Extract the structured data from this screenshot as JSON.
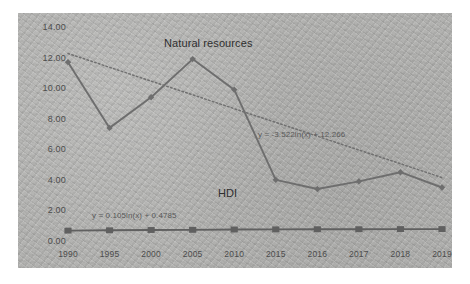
{
  "chart_data": {
    "type": "line",
    "title": "",
    "xlabel": "",
    "ylabel": "",
    "ylim": [
      0,
      14
    ],
    "ytick_step": 2,
    "grid": false,
    "legend_position": "inline-annotations",
    "categories": [
      "1990",
      "1995",
      "2000",
      "2005",
      "2010",
      "2015",
      "2016",
      "2017",
      "2018",
      "2019"
    ],
    "ytick_labels": [
      "0.00",
      "2.00",
      "4.00",
      "6.00",
      "8.00",
      "10.00",
      "12.00",
      "14.00"
    ],
    "series": [
      {
        "name": "Natural resources",
        "marker": "diamond",
        "color": "#6e6e6e",
        "values": [
          11.7,
          7.4,
          9.4,
          11.9,
          9.9,
          4.0,
          3.4,
          3.9,
          4.5,
          3.5
        ]
      },
      {
        "name": "HDI",
        "marker": "square",
        "color": "#606060",
        "values": [
          0.68,
          0.7,
          0.72,
          0.73,
          0.75,
          0.76,
          0.77,
          0.77,
          0.78,
          0.78
        ]
      }
    ],
    "trendlines": [
      {
        "for": "Natural resources",
        "style": "dotted",
        "equation": "y = -3.522ln(x) + 12.266",
        "slope": -3.522,
        "intercept": 12.266,
        "start_value": 12.266,
        "end_value": 4.15
      },
      {
        "for": "HDI",
        "style": "solid",
        "equation": "y = 0.105ln(x) + 0.4785",
        "slope": 0.105,
        "intercept": 0.4785
      }
    ],
    "annotations": [
      {
        "name": "natural-resources-label",
        "text": "Natural resources"
      },
      {
        "name": "hdi-label",
        "text": "HDI"
      },
      {
        "name": "natural-resources-equation",
        "text": "y = -3.522ln(x) + 12.266"
      },
      {
        "name": "hdi-equation",
        "text": "y = 0.105ln(x) + 0.4785"
      }
    ],
    "colors": {
      "panel_background": "#b2b2b0",
      "page_background": "#ffffff",
      "series_line": "#6e6e6e",
      "trendline": "#707070",
      "axis_text": "#4c4c4c"
    }
  }
}
